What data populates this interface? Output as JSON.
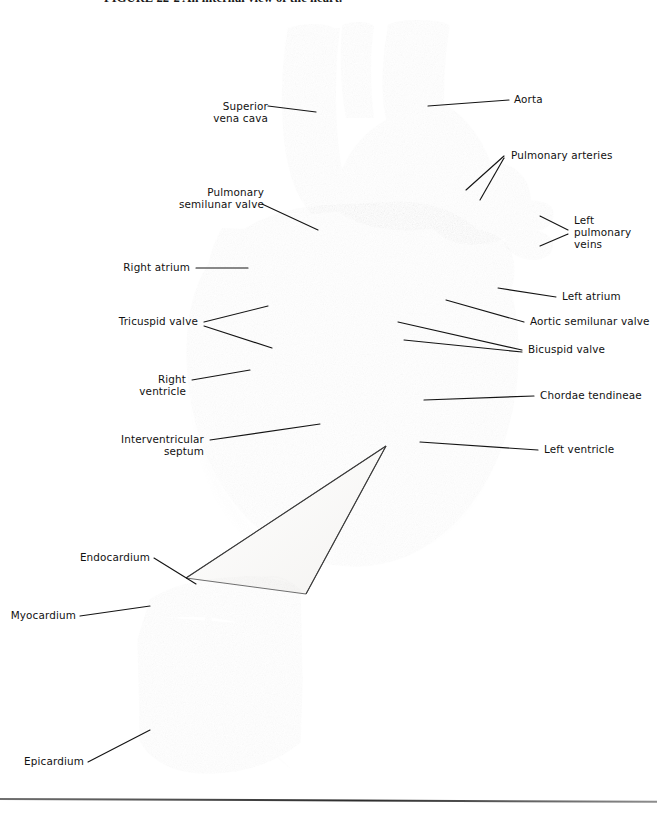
{
  "figure": {
    "caption": "FIGURE 22-2  An internal view of the heart.",
    "kind": "anatomical-illustration",
    "style": "grayscale airbrush medical art with leader-line callouts"
  },
  "labels": {
    "superior_vena_cava": "Superior\nvena cava",
    "aorta": "Aorta",
    "pulmonary_arteries": "Pulmonary arteries",
    "left_pulmonary_veins": "Left\npulmonary\nveins",
    "pulmonary_semilunar_valve": "Pulmonary\nsemilunar valve",
    "right_atrium": "Right atrium",
    "left_atrium": "Left atrium",
    "tricuspid_valve": "Tricuspid valve",
    "aortic_semilunar_valve": "Aortic semilunar valve",
    "bicuspid_valve": "Bicuspid valve",
    "right_ventricle": "Right ventricle",
    "chordae_tendineae": "Chordae tendineae",
    "interventricular_septum": "Interventricular septum",
    "left_ventricle": "Left ventricle",
    "endocardium": "Endocardium",
    "myocardium": "Myocardium",
    "epicardium": "Epicardium"
  },
  "colors": {
    "page": "#ffffff",
    "ink": "#111111",
    "leader_line": "#1a1a1a",
    "tissue_light": "#d8d4cf",
    "tissue_mid": "#a9a39c",
    "tissue_dark": "#6d6762",
    "chamber_shadow": "#4f4a46",
    "vessel": "#8e8880",
    "rule": "#2c2c2c"
  },
  "inset": {
    "title": "heart wall layers",
    "layers": [
      "Endocardium",
      "Myocardium",
      "Epicardium"
    ]
  }
}
